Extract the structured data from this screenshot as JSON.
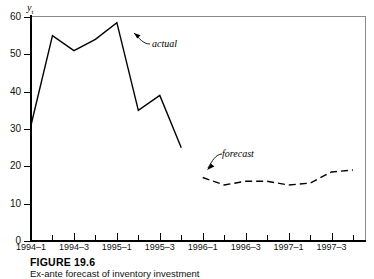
{
  "figure": {
    "caption_title": "FIGURE 19.6",
    "caption_subtitle": "Ex-ante forecast of inventory investment"
  },
  "annotations": {
    "actual": "actual",
    "forecast": "forecast"
  },
  "chart_data": {
    "type": "line",
    "title": "",
    "subtitle": "",
    "xlabel": "",
    "ylabel": "yₜ",
    "ylim": [
      0,
      60
    ],
    "yticks": [
      0,
      10,
      20,
      30,
      40,
      50,
      60
    ],
    "ytick_labels": [
      "0",
      "10",
      "20",
      "30",
      "40",
      "50",
      "60"
    ],
    "grid": false,
    "legend_position": "inline-annotation",
    "x": [
      "1994-1",
      "1994-2",
      "1994-3",
      "1994-4",
      "1995-1",
      "1995-2",
      "1995-3",
      "1995-4",
      "1996-1",
      "1996-2",
      "1996-3",
      "1996-4",
      "1997-1",
      "1997-2",
      "1997-3",
      "1997-4"
    ],
    "xtick_labels": [
      "1994–1",
      "",
      "1994–3",
      "",
      "1995–1",
      "",
      "1995–3",
      "",
      "1996–1",
      "",
      "1996–3",
      "",
      "1997–1",
      "",
      "1997–3",
      ""
    ],
    "xtick_labels_shown": [
      "1994–1",
      "1994–3",
      "1995–1",
      "1995–3",
      "1996–1",
      "1996–3",
      "1997–1",
      "1997–3"
    ],
    "series": [
      {
        "name": "actual",
        "style": "solid",
        "color": "#000000",
        "x": [
          "1994-1",
          "1994-2",
          "1994-3",
          "1994-4",
          "1995-1",
          "1995-2",
          "1995-3",
          "1995-4"
        ],
        "values": [
          31,
          55,
          51,
          54,
          58.5,
          35,
          39,
          25
        ]
      },
      {
        "name": "forecast",
        "style": "dashed",
        "color": "#000000",
        "x": [
          "1996-1",
          "1996-2",
          "1996-3",
          "1996-4",
          "1997-1",
          "1997-2",
          "1997-3",
          "1997-4"
        ],
        "values": [
          17,
          15,
          16,
          16,
          15,
          15.5,
          18.5,
          19
        ]
      }
    ],
    "annotations": [
      {
        "text": "actual",
        "points_to": "1995-1"
      },
      {
        "text": "forecast",
        "points_to": "1996-1"
      }
    ]
  }
}
